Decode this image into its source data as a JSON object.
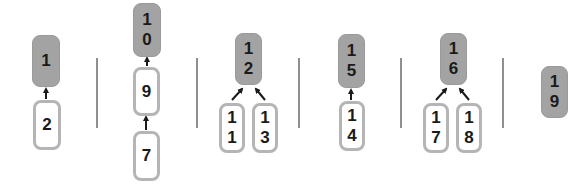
{
  "diagram": {
    "colors": {
      "root_fill": "#a3a3a3",
      "child_border": "#b5b5b5",
      "arrow": "#1a1a1a",
      "separator": "#8f8f8f",
      "text": "#1a1a1a"
    },
    "groups": [
      {
        "root": "1",
        "children": [
          "2"
        ],
        "chain": []
      },
      {
        "root": "10",
        "children": [
          "9"
        ],
        "chain": [
          "7"
        ]
      },
      {
        "root": "12",
        "children": [
          "11",
          "13"
        ],
        "chain": []
      },
      {
        "root": "15",
        "children": [
          "14"
        ],
        "chain": []
      },
      {
        "root": "16",
        "children": [
          "17",
          "18"
        ],
        "chain": []
      },
      {
        "root": "19",
        "children": [],
        "chain": []
      }
    ],
    "edges": [
      {
        "from": "2",
        "to": "1"
      },
      {
        "from": "9",
        "to": "10"
      },
      {
        "from": "7",
        "to": "9"
      },
      {
        "from": "11",
        "to": "12"
      },
      {
        "from": "13",
        "to": "12"
      },
      {
        "from": "14",
        "to": "15"
      },
      {
        "from": "17",
        "to": "16"
      },
      {
        "from": "18",
        "to": "16"
      }
    ]
  }
}
